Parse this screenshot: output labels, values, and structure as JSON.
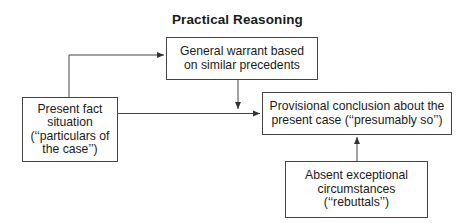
{
  "diagram": {
    "title": "Practical Reasoning",
    "nodes": {
      "facts": {
        "lines": [
          "Present fact",
          "situation",
          "(‘‘particulars of",
          "the case’’)"
        ]
      },
      "warrant": {
        "lines": [
          "General warrant based",
          "on similar precedents"
        ]
      },
      "conclusion": {
        "lines": [
          "Provisional conclusion about the",
          "present case (‘‘presumably so’’)"
        ]
      },
      "rebuttals": {
        "lines": [
          "Absent exceptional",
          "circumstances",
          "(‘‘rebuttals’’)"
        ]
      }
    },
    "edges": [
      {
        "from": "facts",
        "to": "warrant"
      },
      {
        "from": "facts",
        "to": "conclusion"
      },
      {
        "from": "warrant",
        "to": "conclusion"
      },
      {
        "from": "rebuttals",
        "to": "conclusion"
      }
    ],
    "colors": {
      "line": "#444444",
      "text": "#1a1a1a",
      "background": "#ffffff"
    }
  }
}
